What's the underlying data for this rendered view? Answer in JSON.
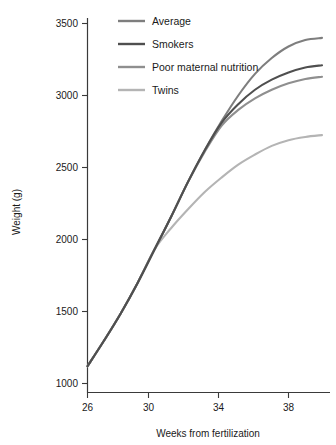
{
  "chart_data": {
    "type": "line",
    "title": "",
    "xlabel": "Weeks from fertilization",
    "ylabel": "Weight (g)",
    "xlim": [
      26,
      40
    ],
    "ylim": [
      1000,
      3500
    ],
    "xticks": [
      26,
      30,
      34,
      38
    ],
    "yticks": [
      1000,
      1500,
      2000,
      2500,
      3000,
      3500
    ],
    "grid": false,
    "legend_position": "top-left",
    "x": [
      26,
      27,
      28,
      29,
      30,
      31,
      32,
      33,
      34,
      35,
      36,
      37,
      38,
      39,
      40
    ],
    "series": [
      {
        "name": "Average",
        "color": "#7e7e7e",
        "values": [
          1120,
          1300,
          1490,
          1700,
          1930,
          2160,
          2400,
          2620,
          2820,
          3000,
          3150,
          3260,
          3340,
          3385,
          3400
        ]
      },
      {
        "name": "Smokers",
        "color": "#4f4f4f",
        "values": [
          1120,
          1300,
          1490,
          1700,
          1930,
          2160,
          2400,
          2620,
          2810,
          2940,
          3040,
          3110,
          3160,
          3195,
          3210
        ]
      },
      {
        "name": "Poor maternal nutrition",
        "color": "#8f8f8f",
        "values": [
          1120,
          1300,
          1490,
          1700,
          1930,
          2160,
          2400,
          2610,
          2790,
          2900,
          2980,
          3040,
          3085,
          3115,
          3130
        ]
      },
      {
        "name": "Twins",
        "color": "#b4b4b4",
        "values": [
          1120,
          1300,
          1490,
          1700,
          1930,
          2080,
          2210,
          2330,
          2430,
          2520,
          2590,
          2650,
          2690,
          2712,
          2725
        ]
      }
    ]
  },
  "axes": {
    "y_title": "Weight (g)",
    "x_title": "Weeks from fertilization",
    "y_tick_labels": [
      "3500",
      "3000",
      "2500",
      "2000",
      "1500",
      "1000"
    ],
    "x_tick_labels": [
      "26",
      "30",
      "34",
      "38"
    ]
  },
  "legend": {
    "items": [
      {
        "label": "Average",
        "color": "#7e7e7e"
      },
      {
        "label": "Smokers",
        "color": "#4f4f4f"
      },
      {
        "label": "Poor maternal nutrition",
        "color": "#8f8f8f"
      },
      {
        "label": "Twins",
        "color": "#b4b4b4"
      }
    ]
  }
}
